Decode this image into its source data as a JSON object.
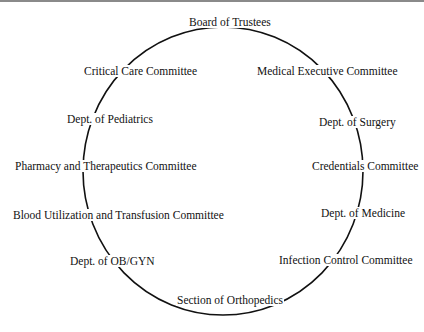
{
  "diagram": {
    "type": "circular-organization-diagram",
    "ring_color": "#111111",
    "background": "#ffffff",
    "nodes": [
      {
        "label": "Board of Trustees"
      },
      {
        "label": "Medical Executive Committee"
      },
      {
        "label": "Dept. of Surgery"
      },
      {
        "label": "Credentials Committee"
      },
      {
        "label": "Dept. of Medicine"
      },
      {
        "label": "Infection Control Committee"
      },
      {
        "label": "Section of Orthopedics"
      },
      {
        "label": "Dept. of OB/GYN"
      },
      {
        "label": "Blood Utilization and Transfusion Committee"
      },
      {
        "label": "Pharmacy and Therapeutics Committee"
      },
      {
        "label": "Dept. of Pediatrics"
      },
      {
        "label": "Critical Care Committee"
      }
    ]
  }
}
